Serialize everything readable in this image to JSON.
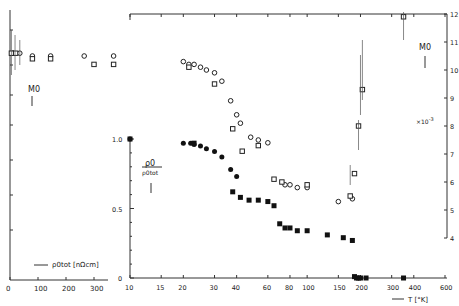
{
  "chart_data": [
    {
      "type": "scatter",
      "title": "",
      "panel": "left-inset",
      "xlabel": "ρ0tot [nΩcm]",
      "x_ticks": [
        0,
        100,
        200,
        300
      ],
      "xlim": [
        0,
        350
      ],
      "annotation": "M0",
      "series": [
        {
          "name": "M0 circles",
          "marker": "open-circle",
          "x": [
            10,
            35,
            80,
            145,
            265,
            370
          ],
          "y": [
            10.6,
            10.6,
            10.5,
            10.5,
            10.5,
            10.5
          ]
        },
        {
          "name": "M0 squares",
          "marker": "open-square",
          "x": [
            5,
            20,
            80,
            145,
            300,
            370
          ],
          "y": [
            10.6,
            10.6,
            10.4,
            10.4,
            10.2,
            10.2
          ]
        }
      ]
    },
    {
      "type": "scatter",
      "panel": "main",
      "xlabel": "T [°K]",
      "xscale": "log",
      "x_ticks": [
        10,
        15,
        20,
        30,
        40,
        60,
        80,
        100,
        150,
        200,
        300,
        400,
        600
      ],
      "xlim": [
        10,
        650
      ],
      "ylabel_left": "ρ0 / ρ0tot",
      "y_left_ticks": [
        0,
        0.5,
        1.0
      ],
      "ylabel_right": "M0 ×10^-3",
      "y_right_ticks": [
        4,
        5,
        6,
        7,
        8,
        9,
        10,
        11,
        12
      ],
      "series": [
        {
          "name": "M0 open circles (right axis)",
          "marker": "open-circle",
          "axis": "right",
          "x": [
            20,
            21.5,
            23,
            25,
            27,
            30,
            33,
            37,
            40,
            42,
            48,
            53,
            60,
            75,
            80,
            88,
            100,
            150,
            180
          ],
          "y": [
            10.3,
            10.2,
            10.2,
            10.1,
            10.0,
            9.9,
            9.6,
            8.9,
            8.4,
            8.1,
            7.6,
            7.5,
            7.4,
            5.9,
            5.9,
            5.8,
            5.8,
            5.3,
            5.4
          ]
        },
        {
          "name": "M0 open squares (right axis)",
          "marker": "open-square",
          "axis": "right",
          "x": [
            21.5,
            30,
            38,
            43,
            53,
            65,
            72,
            100,
            175,
            185,
            195,
            205,
            350
          ],
          "y": [
            10.1,
            9.5,
            7.9,
            7.1,
            7.3,
            6.1,
            6.0,
            5.9,
            5.5,
            6.3,
            8.0,
            9.3,
            11.9
          ]
        },
        {
          "name": "ρ0/ρ0tot filled circles",
          "marker": "filled-circle",
          "axis": "left",
          "x": [
            10,
            20,
            22,
            23,
            25,
            27,
            30,
            33,
            37,
            40
          ],
          "y": [
            1.0,
            0.97,
            0.97,
            0.96,
            0.95,
            0.93,
            0.91,
            0.87,
            0.78,
            0.73
          ]
        },
        {
          "name": "ρ0/ρ0tot filled squares",
          "marker": "filled-square",
          "axis": "left",
          "x": [
            10,
            23,
            38,
            42,
            47,
            53,
            60,
            65,
            70,
            75,
            80,
            88,
            100,
            130,
            160,
            180,
            185,
            190,
            195,
            200,
            215,
            350
          ],
          "y": [
            1.0,
            0.97,
            0.62,
            0.58,
            0.56,
            0.56,
            0.55,
            0.52,
            0.39,
            0.36,
            0.36,
            0.34,
            0.34,
            0.31,
            0.29,
            0.27,
            0.01,
            0.0,
            0.0,
            0.0,
            0.0,
            0.0
          ]
        }
      ]
    }
  ],
  "labels": {
    "m0_left": "M0",
    "m0_right": "M0",
    "ratio_num": "ρ0",
    "ratio_den": "ρ0tot",
    "scale": "×10",
    "scale_exp": "-3",
    "x_left_label": "ρ0tot [nΩcm]",
    "x_main_label": "T [°K]",
    "y_zero": "0",
    "y_half": "0.5",
    "y_one": "1.0"
  }
}
